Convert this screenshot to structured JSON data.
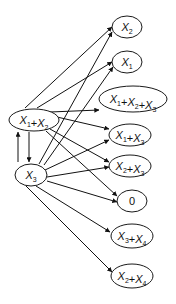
{
  "diagram": {
    "type": "directed-graph",
    "colors": {
      "stroke": "#111111",
      "fill": "#ffffff"
    },
    "nodes": [
      {
        "id": "x1x2",
        "terms": [
          {
            "v": "X",
            "s": "1"
          },
          {
            "v": "X",
            "s": "2"
          }
        ],
        "label": "X1+X2",
        "column": "source"
      },
      {
        "id": "x3",
        "terms": [
          {
            "v": "X",
            "s": "3"
          }
        ],
        "label": "X3",
        "column": "source"
      },
      {
        "id": "t_x2",
        "terms": [
          {
            "v": "X",
            "s": "2"
          }
        ],
        "label": "X2",
        "column": "target"
      },
      {
        "id": "t_x1",
        "terms": [
          {
            "v": "X",
            "s": "1"
          }
        ],
        "label": "X1",
        "column": "target"
      },
      {
        "id": "t_x1x2x3",
        "terms": [
          {
            "v": "X",
            "s": "1"
          },
          {
            "v": "X",
            "s": "2"
          },
          {
            "v": "X",
            "s": "3"
          }
        ],
        "label": "X1+X2+X3",
        "column": "target"
      },
      {
        "id": "t_x1x3",
        "terms": [
          {
            "v": "X",
            "s": "1"
          },
          {
            "v": "X",
            "s": "3"
          }
        ],
        "label": "X1+X3",
        "column": "target"
      },
      {
        "id": "t_x2x3",
        "terms": [
          {
            "v": "X",
            "s": "2"
          },
          {
            "v": "X",
            "s": "3"
          }
        ],
        "label": "X2+X3",
        "column": "target"
      },
      {
        "id": "t_zero",
        "terms": [
          {
            "v": "0",
            "s": ""
          }
        ],
        "label": "0",
        "column": "target"
      },
      {
        "id": "t_x3x4",
        "terms": [
          {
            "v": "X",
            "s": "3"
          },
          {
            "v": "X",
            "s": "4"
          }
        ],
        "label": "X3+X4",
        "column": "target"
      },
      {
        "id": "t_x2x4",
        "terms": [
          {
            "v": "X",
            "s": "2"
          },
          {
            "v": "X",
            "s": "4"
          }
        ],
        "label": "X2+X4",
        "column": "target"
      }
    ],
    "edges": [
      {
        "from": "x1x2",
        "to": "x3"
      },
      {
        "from": "x3",
        "to": "x1x2"
      },
      {
        "from": "x1x2",
        "to": "t_x2"
      },
      {
        "from": "x1x2",
        "to": "t_x1"
      },
      {
        "from": "x1x2",
        "to": "t_x1x2x3"
      },
      {
        "from": "x1x2",
        "to": "t_x1x3"
      },
      {
        "from": "x1x2",
        "to": "t_x2x3"
      },
      {
        "from": "x1x2",
        "to": "t_zero"
      },
      {
        "from": "x3",
        "to": "t_x2"
      },
      {
        "from": "x3",
        "to": "t_x1"
      },
      {
        "from": "x3",
        "to": "t_x1x3"
      },
      {
        "from": "x3",
        "to": "t_x2x3"
      },
      {
        "from": "x3",
        "to": "t_zero"
      },
      {
        "from": "x3",
        "to": "t_x3x4"
      },
      {
        "from": "x3",
        "to": "t_x2x4"
      }
    ]
  }
}
